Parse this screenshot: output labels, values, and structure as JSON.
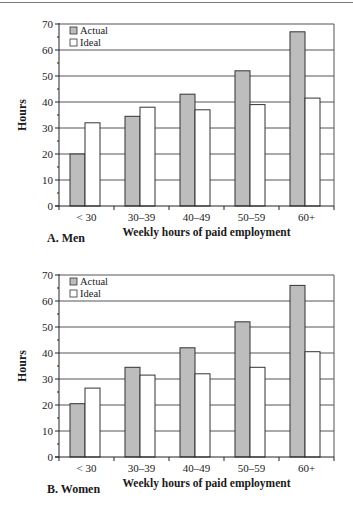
{
  "chart_data": [
    {
      "type": "bar",
      "title": "A. Men",
      "xlabel": "Weekly hours of paid employment",
      "ylabel": "Hours",
      "ylim": [
        0,
        70
      ],
      "yticks": [
        0,
        10,
        20,
        30,
        40,
        50,
        60,
        70
      ],
      "grid": true,
      "legend_position": "upper left",
      "categories": [
        "< 30",
        "30–39",
        "40–49",
        "50–59",
        "60+"
      ],
      "series": [
        {
          "name": "Actual",
          "color": "#bdbdbd",
          "values": [
            20,
            34.5,
            43,
            52,
            67
          ]
        },
        {
          "name": "Ideal",
          "color": "#ffffff",
          "values": [
            32,
            38,
            37,
            39,
            41.5
          ]
        }
      ]
    },
    {
      "type": "bar",
      "title": "B. Women",
      "xlabel": "Weekly hours of paid employment",
      "ylabel": "Hours",
      "ylim": [
        0,
        70
      ],
      "yticks": [
        0,
        10,
        20,
        30,
        40,
        50,
        60,
        70
      ],
      "grid": true,
      "legend_position": "upper left",
      "categories": [
        "< 30",
        "30–39",
        "40–49",
        "50–59",
        "60+"
      ],
      "series": [
        {
          "name": "Actual",
          "color": "#bdbdbd",
          "values": [
            20.5,
            34.5,
            42,
            52,
            66
          ]
        },
        {
          "name": "Ideal",
          "color": "#ffffff",
          "values": [
            26.5,
            31.5,
            32,
            34.5,
            40.5
          ]
        }
      ]
    }
  ],
  "panels": {
    "a_label": "A. Men",
    "b_label": "B. Women"
  }
}
